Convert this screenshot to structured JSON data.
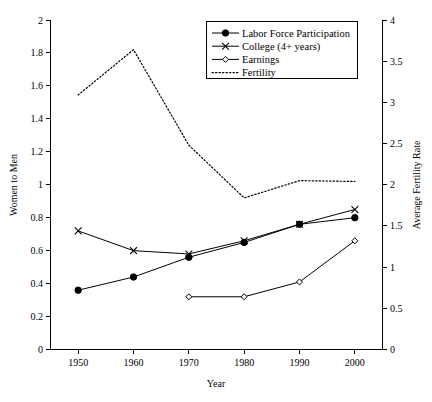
{
  "chart_data": {
    "type": "line",
    "title": "",
    "xlabel": "Year",
    "ylabel": "Women to Men",
    "y2label": "Average Fertility Rate",
    "x": [
      1950,
      1960,
      1970,
      1980,
      1990,
      2000
    ],
    "xlim": [
      1945,
      2005
    ],
    "ylim": [
      0,
      2
    ],
    "y2lim": [
      0,
      4
    ],
    "grid": false,
    "legend_position": "top-right",
    "xticks": [
      "1950",
      "1960",
      "1970",
      "1980",
      "1990",
      "2000"
    ],
    "yticks": [
      "0",
      "0.2",
      "0.4",
      "0.6",
      "0.8",
      "1",
      "1.2",
      "1.4",
      "1.6",
      "1.8",
      "2"
    ],
    "y2ticks": [
      "0",
      "0.5",
      "1",
      "1.5",
      "2",
      "2.5",
      "3",
      "3.5",
      "4"
    ],
    "series": [
      {
        "name": "Labor Force Participation",
        "axis": "left",
        "marker": "filled-circle",
        "linestyle": "solid",
        "x": [
          1950,
          1960,
          1970,
          1980,
          1990,
          2000
        ],
        "values": [
          0.36,
          0.44,
          0.56,
          0.65,
          0.76,
          0.8
        ]
      },
      {
        "name": "College (4+ years)",
        "axis": "left",
        "marker": "cross",
        "linestyle": "solid",
        "x": [
          1950,
          1960,
          1970,
          1980,
          1990,
          2000
        ],
        "values": [
          0.72,
          0.6,
          0.58,
          0.66,
          0.76,
          0.85
        ]
      },
      {
        "name": "Earnings",
        "axis": "left",
        "marker": "open-diamond",
        "linestyle": "solid",
        "x": [
          1970,
          1980,
          1990,
          2000
        ],
        "values": [
          0.32,
          0.32,
          0.41,
          0.66
        ]
      },
      {
        "name": "Fertility",
        "axis": "right",
        "marker": "none",
        "linestyle": "dotted",
        "x": [
          1950,
          1960,
          1970,
          1980,
          1990,
          2000
        ],
        "values": [
          3.09,
          3.64,
          2.48,
          1.84,
          2.05,
          2.04
        ]
      }
    ]
  },
  "legend": {
    "items": [
      {
        "label": "Labor Force Participation",
        "marker": "filled-circle"
      },
      {
        "label": "College (4+ years)",
        "marker": "cross"
      },
      {
        "label": "Earnings",
        "marker": "open-diamond"
      },
      {
        "label": "Fertility",
        "marker": "dotted-line"
      }
    ]
  },
  "axes": {
    "x_title": "Year",
    "y_left_title": "Women to Men",
    "y_right_title": "Average Fertility Rate"
  },
  "colors": {
    "foreground": "#000000",
    "background": "#ffffff"
  }
}
